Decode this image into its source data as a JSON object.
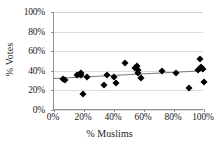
{
  "chart_data": {
    "type": "scatter",
    "title": "",
    "xlabel": "% Muslims",
    "ylabel": "% Votes",
    "xlim": [
      0,
      100
    ],
    "ylim": [
      0,
      100
    ],
    "xticks": [
      0,
      20,
      40,
      60,
      80,
      100
    ],
    "yticks": [
      0,
      20,
      40,
      60,
      80,
      100
    ],
    "xtick_labels": [
      "0%",
      "20%",
      "40%",
      "60%",
      "80%",
      "100%"
    ],
    "ytick_labels": [
      "0%",
      "20%",
      "40%",
      "60%",
      "80%",
      "100%"
    ],
    "grid": "horizontal",
    "legend": "none",
    "marker_style": "diamond",
    "marker_color": "#000000",
    "trendline_color": "#7a7a7a",
    "points": [
      {
        "x": 6,
        "y": 32
      },
      {
        "x": 7,
        "y": 31
      },
      {
        "x": 15,
        "y": 36
      },
      {
        "x": 17,
        "y": 37
      },
      {
        "x": 18,
        "y": 36
      },
      {
        "x": 18,
        "y": 38
      },
      {
        "x": 19,
        "y": 16
      },
      {
        "x": 22,
        "y": 34
      },
      {
        "x": 33,
        "y": 26
      },
      {
        "x": 35,
        "y": 36
      },
      {
        "x": 40,
        "y": 34
      },
      {
        "x": 41,
        "y": 28
      },
      {
        "x": 47,
        "y": 48
      },
      {
        "x": 54,
        "y": 43
      },
      {
        "x": 55,
        "y": 45
      },
      {
        "x": 56,
        "y": 41
      },
      {
        "x": 56,
        "y": 38
      },
      {
        "x": 58,
        "y": 33
      },
      {
        "x": 72,
        "y": 40
      },
      {
        "x": 81,
        "y": 38
      },
      {
        "x": 90,
        "y": 22
      },
      {
        "x": 96,
        "y": 41
      },
      {
        "x": 97,
        "y": 52
      },
      {
        "x": 98,
        "y": 44
      },
      {
        "x": 99,
        "y": 42
      },
      {
        "x": 100,
        "y": 29
      }
    ],
    "trendline": {
      "x1": 0,
      "y1": 32.5,
      "x2": 100,
      "y2": 40.5
    }
  }
}
